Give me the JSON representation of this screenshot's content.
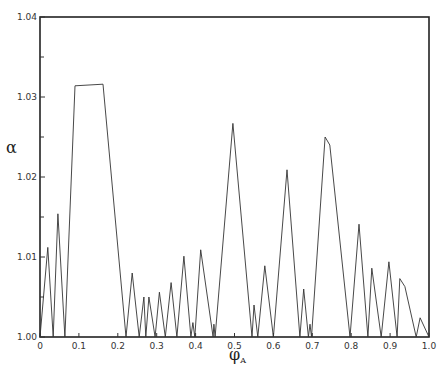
{
  "chart_data": {
    "type": "line",
    "title": "",
    "xlabel": "φ_A",
    "ylabel": "α",
    "xlim": [
      0,
      1.0
    ],
    "ylim": [
      1.0,
      1.04
    ],
    "grid": false,
    "legend": null,
    "x_ticks": [
      0,
      0.1,
      0.2,
      0.3,
      0.4,
      0.5,
      0.6,
      0.7,
      0.8,
      0.9,
      1.0
    ],
    "x_tick_labels": [
      "0",
      "0.1",
      "0.2",
      "0.3",
      "0.4",
      "0.5",
      "0.6",
      "0.7",
      "0.8",
      "0.9",
      "1.0"
    ],
    "y_ticks": [
      1.0,
      1.01,
      1.02,
      1.03,
      1.04
    ],
    "y_tick_labels": [
      "1.00",
      "1.01",
      "1.02",
      "1.03",
      "1.04"
    ],
    "series": [
      {
        "name": "alpha",
        "x": [
          0,
          0.02,
          0.034,
          0.046,
          0.064,
          0.09,
          0.162,
          0.221,
          0.237,
          0.255,
          0.267,
          0.272,
          0.28,
          0.296,
          0.307,
          0.322,
          0.337,
          0.352,
          0.37,
          0.388,
          0.393,
          0.398,
          0.413,
          0.445,
          0.447,
          0.45,
          0.496,
          0.545,
          0.55,
          0.56,
          0.578,
          0.6,
          0.635,
          0.668,
          0.678,
          0.69,
          0.694,
          0.698,
          0.733,
          0.745,
          0.797,
          0.82,
          0.843,
          0.853,
          0.877,
          0.897,
          0.918,
          0.925,
          0.938,
          0.967,
          0.977,
          1.0
        ],
        "y": [
          1.0,
          1.0112,
          1.0,
          1.0154,
          1.0,
          1.0314,
          1.0316,
          1.0,
          1.008,
          1.0,
          1.005,
          1.0,
          1.005,
          1.0,
          1.0056,
          1.0,
          1.0068,
          1.0,
          1.0101,
          1.0,
          1.0018,
          1.0,
          1.0109,
          1.0,
          1.0016,
          1.0,
          1.0267,
          1.0,
          1.004,
          1.0,
          1.0089,
          1.0,
          1.0209,
          1.0,
          1.006,
          1.0,
          1.0016,
          1.0,
          1.025,
          1.024,
          1.0,
          1.0141,
          1.0,
          1.0086,
          1.0,
          1.0094,
          1.0,
          1.0073,
          1.0063,
          1.0,
          1.0024,
          1.0
        ]
      }
    ]
  }
}
